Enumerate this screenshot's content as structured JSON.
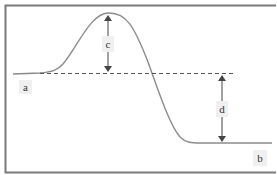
{
  "diagram": {
    "type": "energy-profile",
    "labels": {
      "a": "a",
      "b": "b",
      "c": "c",
      "d": "d"
    },
    "colors": {
      "border": "#7a7a7a",
      "curve": "#8c8c8c",
      "dashed": "#555555",
      "arrow": "#444444",
      "label_bg": "#f0f0f0",
      "text": "#333333"
    },
    "annotations": [
      {
        "id": "c",
        "meaning": "vertical arrow from dashed baseline up to peak"
      },
      {
        "id": "d",
        "meaning": "vertical arrow from dashed baseline down to final level"
      }
    ]
  }
}
